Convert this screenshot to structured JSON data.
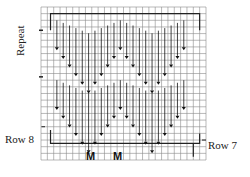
{
  "labels": {
    "repeat": "Repeat",
    "row_left": "Row 8",
    "row_right": "Row 7",
    "marker_1": "M",
    "marker_2": "M"
  },
  "grid": {
    "columns": 26,
    "rows": 23,
    "line_color": "#8a8a8a",
    "outline_color": "#222222",
    "arrow_color": "#111111"
  },
  "pattern": {
    "description": "Two repeating W-shaped bands of downward arrows (decreases) forming chevrons",
    "bands": [
      {
        "name": "upper-band",
        "arrow_columns": [
          3,
          4,
          5,
          6,
          7,
          8,
          9,
          10,
          11,
          12,
          13,
          14,
          15,
          16,
          17,
          18,
          19,
          20,
          21
        ],
        "depth_steps": [
          0,
          1,
          2,
          3,
          4,
          5,
          4,
          3,
          2,
          1,
          0,
          1,
          2,
          3,
          4,
          5,
          4,
          3,
          2,
          1,
          0
        ]
      },
      {
        "name": "lower-band",
        "arrow_columns": [
          3,
          4,
          5,
          6,
          7,
          8,
          9,
          10,
          11,
          12,
          13,
          14,
          15,
          16,
          17,
          18,
          19,
          20,
          21
        ],
        "depth_steps": [
          0,
          1,
          2,
          3,
          4,
          5,
          4,
          3,
          2,
          1,
          0,
          1,
          2,
          3,
          4,
          5,
          4,
          3,
          2,
          1,
          0
        ]
      }
    ]
  }
}
